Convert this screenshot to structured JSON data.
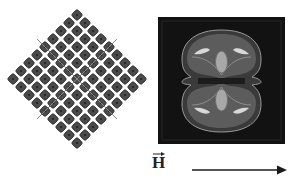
{
  "figure": {
    "left_panel": {
      "description": "Diamond-shaped square lattice of rounded dark squares (rotated 45 degrees), crossed by two diagonal lines",
      "grid_size": 9,
      "center": [
        77,
        79
      ],
      "step": 8,
      "element_color": "#4a4a4a",
      "element_border_color": "#2a2a2a",
      "line_color": "#8a8a8a"
    },
    "right_panel": {
      "description": "Dark square simulation map showing a two-lobed (peanut-shaped) contour pattern",
      "background_color": "#121212",
      "contour_colors": [
        "#6b6b6b",
        "#8c8c8c",
        "#b5b5b5",
        "#e0e0e0"
      ]
    },
    "field_label": {
      "symbol": "H",
      "has_vector_arrow": true
    },
    "field_arrow": {
      "direction": "right",
      "color": "#1a1a1a"
    }
  }
}
